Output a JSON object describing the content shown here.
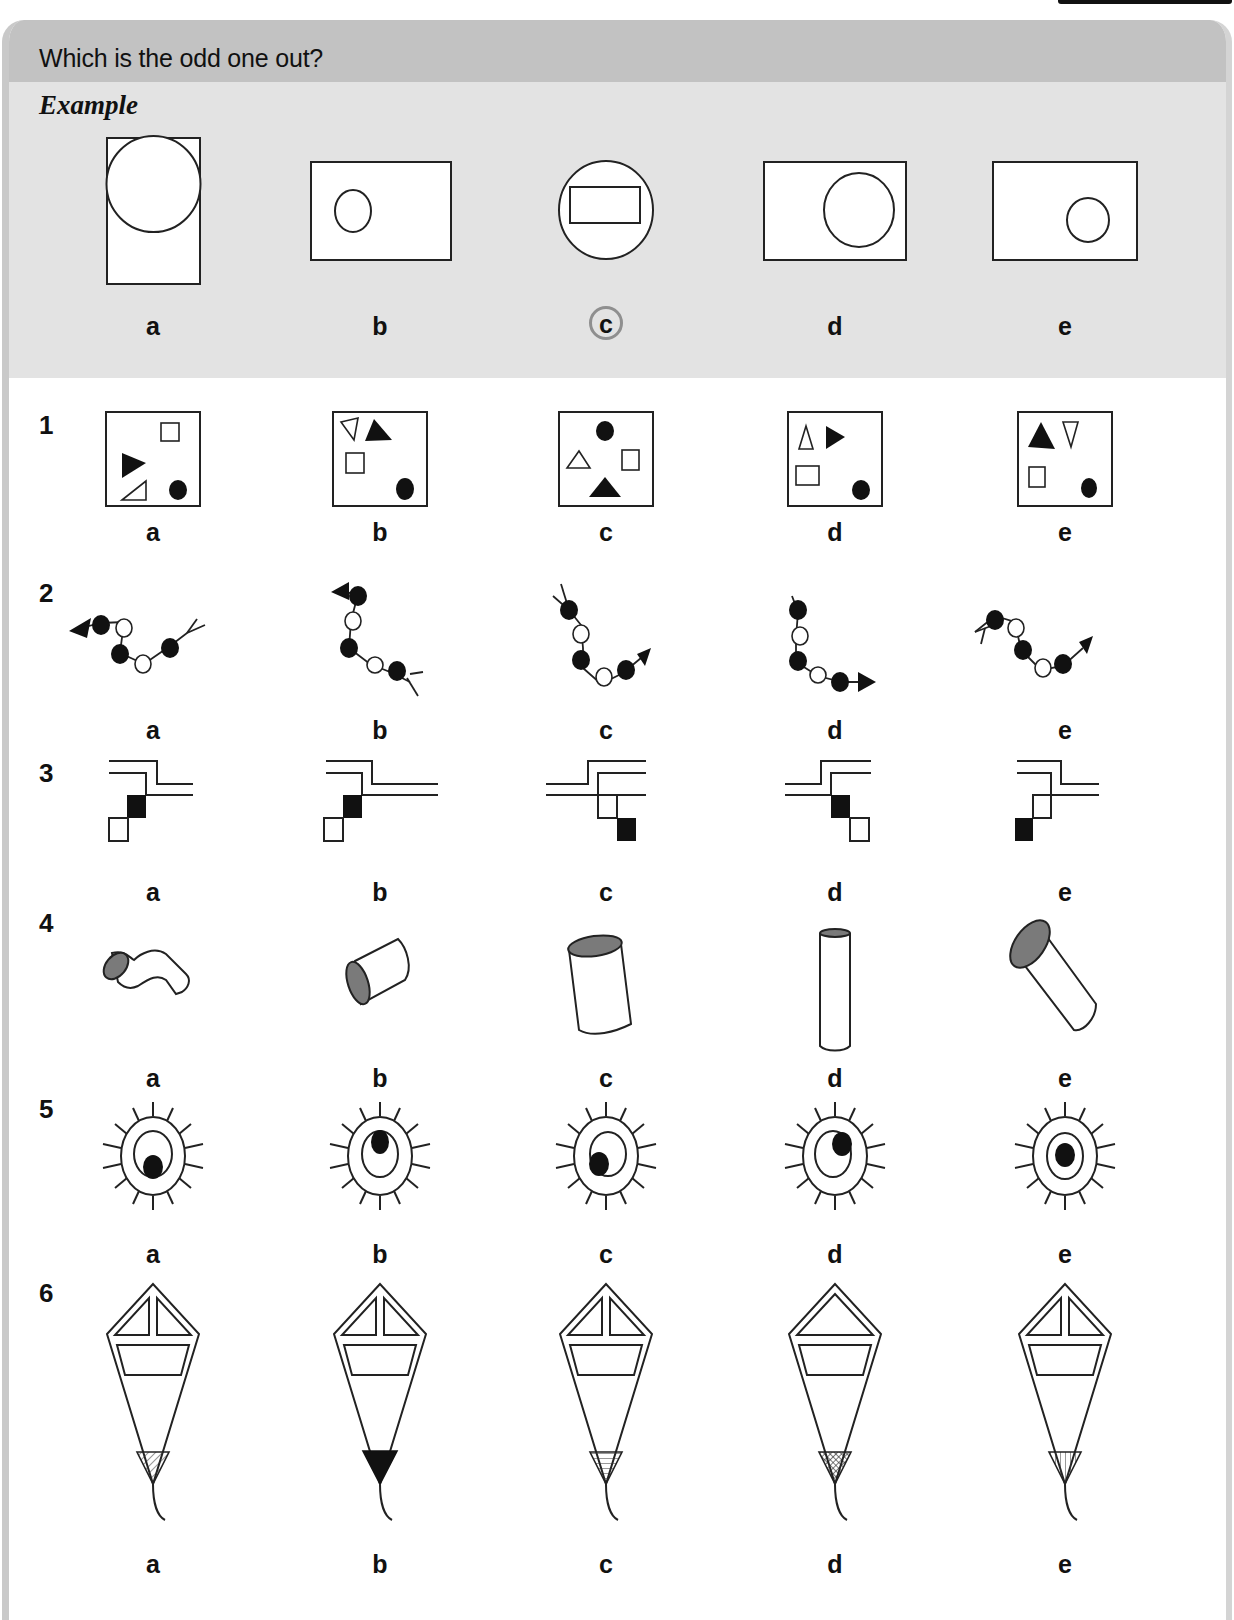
{
  "header": {
    "title": "Which is the odd one out?"
  },
  "example": {
    "label": "Example",
    "answer": "c",
    "options": [
      {
        "letter": "a",
        "figure": "tall rectangle with large circle touching its top"
      },
      {
        "letter": "b",
        "figure": "wide rectangle with small circle on left"
      },
      {
        "letter": "c",
        "figure": "circle containing a rectangle",
        "circled": true
      },
      {
        "letter": "d",
        "figure": "wide rectangle with large circle on right"
      },
      {
        "letter": "e",
        "figure": "wide rectangle with small circle on right"
      }
    ]
  },
  "questions": [
    {
      "number": "1",
      "options": [
        {
          "letter": "a",
          "figure": "square with open square, black triangle, open triangle, black dot"
        },
        {
          "letter": "b",
          "figure": "square with open triangle, black triangle, open square, black dot"
        },
        {
          "letter": "c",
          "figure": "square with black dot, open triangle, open square, black triangle"
        },
        {
          "letter": "d",
          "figure": "square with open triangle, black triangle, open rectangle, black dot"
        },
        {
          "letter": "e",
          "figure": "square with black triangle, open triangle, open square, black dot"
        }
      ]
    },
    {
      "number": "2",
      "options": [
        {
          "letter": "a",
          "figure": "beaded chain with arrowhead left and fork right"
        },
        {
          "letter": "b",
          "figure": "beaded chain with arrowhead top-left and fork bottom-right"
        },
        {
          "letter": "c",
          "figure": "beaded chain with fork top-left and arrowhead right"
        },
        {
          "letter": "d",
          "figure": "beaded chain with stub top and arrowhead right"
        },
        {
          "letter": "e",
          "figure": "beaded chain with fork left and arrowhead right"
        }
      ]
    },
    {
      "number": "3",
      "options": [
        {
          "letter": "a",
          "figure": "stepped double line with black square above open square"
        },
        {
          "letter": "b",
          "figure": "stepped double line with black square above open square"
        },
        {
          "letter": "c",
          "figure": "mirrored stepped lines with open square above black square"
        },
        {
          "letter": "d",
          "figure": "mirrored stepped lines with black square above open square"
        },
        {
          "letter": "e",
          "figure": "stepped double line with open square above black square"
        }
      ]
    },
    {
      "number": "4",
      "options": [
        {
          "letter": "a",
          "figure": "bent tube with shaded end"
        },
        {
          "letter": "b",
          "figure": "short cylinder with shaded end"
        },
        {
          "letter": "c",
          "figure": "tilted cylinder with shaded top"
        },
        {
          "letter": "d",
          "figure": "tall thin cylinder with shaded top"
        },
        {
          "letter": "e",
          "figure": "diagonal cylinder with shaded end"
        }
      ]
    },
    {
      "number": "5",
      "options": [
        {
          "letter": "a",
          "figure": "spiked oval with inner oval, black dot at bottom"
        },
        {
          "letter": "b",
          "figure": "spiked oval with inner oval, black dot at top"
        },
        {
          "letter": "c",
          "figure": "spiked oval with inner oval, black dot at lower left"
        },
        {
          "letter": "d",
          "figure": "spiked oval with inner oval, black dot at upper right"
        },
        {
          "letter": "e",
          "figure": "spiked oval with inner oval, black dot at center"
        }
      ]
    },
    {
      "number": "6",
      "options": [
        {
          "letter": "a",
          "figure": "kite with split triangle top, diagonal hatched tip"
        },
        {
          "letter": "b",
          "figure": "kite with split triangle top, solid black tip"
        },
        {
          "letter": "c",
          "figure": "kite with split triangle top, horizontal hatched tip"
        },
        {
          "letter": "d",
          "figure": "kite with single triangle top, cross-hatched tip"
        },
        {
          "letter": "e",
          "figure": "kite with split triangle top, vertical hatched tip"
        }
      ]
    }
  ],
  "colors": {
    "header_bg": "#c2c2c2",
    "example_bg": "#e3e3e3",
    "answer_circle": "#8f8f8f"
  }
}
